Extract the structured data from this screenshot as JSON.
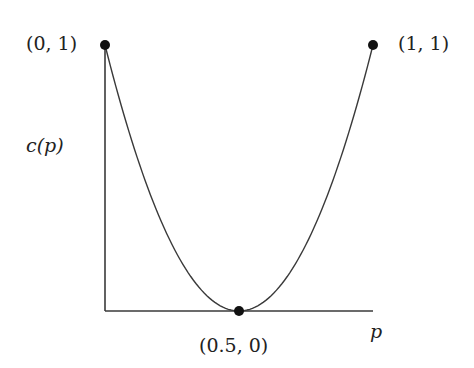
{
  "chart_data": {
    "type": "line",
    "title": "",
    "xlabel": "p",
    "ylabel": "c(p)",
    "xlim": [
      0,
      1
    ],
    "ylim": [
      0,
      1
    ],
    "grid": false,
    "series": [
      {
        "name": "c(p)",
        "x": [
          0,
          0.1,
          0.2,
          0.3,
          0.4,
          0.5,
          0.6,
          0.7,
          0.8,
          0.9,
          1.0
        ],
        "y": [
          1.0,
          0.64,
          0.36,
          0.16,
          0.04,
          0.0,
          0.04,
          0.16,
          0.36,
          0.64,
          1.0
        ]
      }
    ],
    "points": [
      {
        "x": 0,
        "y": 1,
        "label": "(0, 1)"
      },
      {
        "x": 1,
        "y": 1,
        "label": "(1, 1)"
      },
      {
        "x": 0.5,
        "y": 0,
        "label": "(0.5, 0)"
      }
    ]
  },
  "labels": {
    "point_top_left": "(0, 1)",
    "point_top_right": "(1, 1)",
    "point_bottom": "(0.5, 0)",
    "y_axis": "c(p)",
    "x_axis": "p"
  },
  "colors": {
    "line": "#3a3a3a",
    "point": "#111111"
  }
}
